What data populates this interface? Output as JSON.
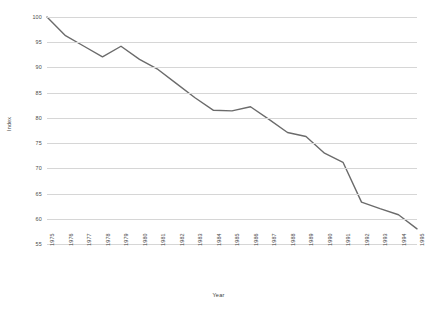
{
  "chart_data": {
    "type": "line",
    "title": "",
    "xlabel": "Year",
    "ylabel": "Index",
    "x": [
      1975,
      1976,
      1977,
      1978,
      1979,
      1980,
      1981,
      1982,
      1983,
      1984,
      1985,
      1986,
      1987,
      1988,
      1989,
      1990,
      1991,
      1992,
      1993,
      1994,
      1995
    ],
    "categories": [
      "1975",
      "1976",
      "1977",
      "1978",
      "1979",
      "1980",
      "1981",
      "1982",
      "1983",
      "1984",
      "1985",
      "1986",
      "1987",
      "1988",
      "1989",
      "1990",
      "1991",
      "1992",
      "1993",
      "1994",
      "1995"
    ],
    "series": [
      {
        "name": "Index",
        "color": "#6b6b6b",
        "values": [
          100.0,
          96.3,
          94.2,
          92.1,
          94.2,
          91.6,
          89.6,
          86.8,
          84.0,
          81.5,
          81.4,
          82.2,
          79.7,
          77.1,
          76.3,
          73.0,
          71.2,
          63.3,
          62.0,
          60.8,
          58.0
        ]
      }
    ],
    "ylim": [
      55,
      100
    ],
    "yticks": [
      55,
      60,
      65,
      70,
      75,
      80,
      85,
      90,
      95,
      100
    ],
    "ytick_labels": [
      "55",
      "60",
      "65",
      "70",
      "75",
      "80",
      "85",
      "90",
      "95",
      "100"
    ],
    "xlim": [
      1975,
      1995
    ],
    "grid": "horizontal",
    "gridline_color": "#d6d6d6",
    "legend": "none",
    "markers": "none",
    "background": "#ffffff"
  }
}
